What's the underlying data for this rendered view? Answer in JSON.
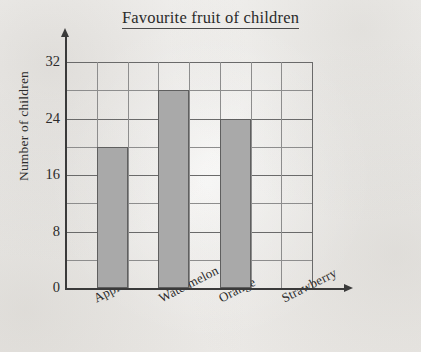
{
  "chart_data": {
    "type": "bar",
    "title": "Favourite fruit of children",
    "xlabel": "",
    "ylabel": "Number of children",
    "categories": [
      "Apple",
      "Watermelon",
      "Orange",
      "Strawberry"
    ],
    "values": [
      20,
      28,
      24,
      0
    ],
    "ylim": [
      0,
      32
    ],
    "ytick_labels": [
      "0",
      "8",
      "16",
      "24",
      "32"
    ],
    "ytick_values": [
      0,
      8,
      16,
      24,
      32
    ],
    "y_gridline_step": 4,
    "grid": true,
    "legend": "none",
    "bar_color": "#a9a9a9",
    "bar_edge_color": "#5f5f5f",
    "grid_color": "#8d8d8d",
    "axis_color": "#3a3a3a",
    "text_color": "#2b2b2b",
    "background_color": "#f2f1ef"
  },
  "artifacts": {
    "bleed_through_note": "faint mirrored show-through text from reverse of scanned page",
    "lines": [
      "",
      "",
      "",
      "",
      "",
      "",
      "",
      ""
    ]
  }
}
